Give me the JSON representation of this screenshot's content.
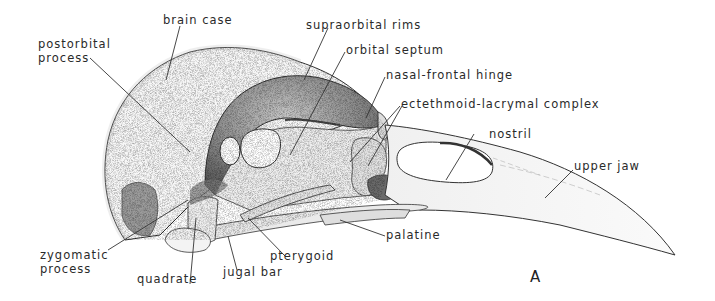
{
  "figure": {
    "panel_letter": "A"
  },
  "labels": {
    "brain_case": "brain case",
    "postorbital_1": "postorbital",
    "postorbital_2": "process",
    "supraorbital_rims": "supraorbital rims",
    "orbital_septum": "orbital septum",
    "nasal_frontal_hinge": "nasal-frontal hinge",
    "ectethmoid_lacrymal": "ectethmoid-lacrymal complex",
    "nostril": "nostril",
    "upper_jaw": "upper jaw",
    "palatine": "palatine",
    "pterygoid": "pterygoid",
    "jugal_bar": "jugal bar",
    "quadrate": "quadrate",
    "zygomatic_1": "zygomatic",
    "zygomatic_2": "process"
  },
  "colors": {
    "ink": "#2a2a2a",
    "shade_dark": "#5a5a5a",
    "shade_mid": "#9a9a9a",
    "shade_light": "#d8d8d8",
    "paper": "#ffffff"
  }
}
